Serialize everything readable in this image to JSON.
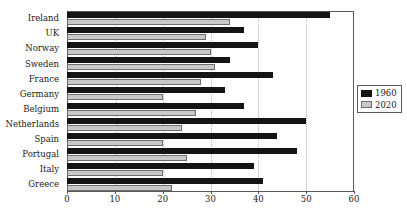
{
  "chart_data": {
    "type": "bar",
    "orientation": "horizontal",
    "title": "",
    "xlabel": "",
    "ylabel": "",
    "xlim": [
      0,
      60
    ],
    "xticks": [
      0,
      10,
      20,
      30,
      40,
      50,
      60
    ],
    "grid": true,
    "legend_position": "right",
    "categories": [
      "Ireland",
      "UK",
      "Norway",
      "Sweden",
      "France",
      "Germany",
      "Belgium",
      "Netherlands",
      "Spain",
      "Portugal",
      "Italy",
      "Greece"
    ],
    "series": [
      {
        "name": "1960",
        "color": "#141414",
        "values": [
          55,
          37,
          40,
          34,
          43,
          33,
          37,
          50,
          44,
          48,
          39,
          41
        ]
      },
      {
        "name": "2020",
        "color": "#c8c8c8",
        "values": [
          34,
          29,
          30,
          31,
          28,
          20,
          27,
          24,
          20,
          25,
          20,
          22
        ]
      }
    ]
  },
  "legend": {
    "entries": [
      {
        "label": "1960"
      },
      {
        "label": "2020"
      }
    ]
  },
  "colors": {
    "series_1960": "#141414",
    "series_2020": "#c8c8c8",
    "frame": "#595959",
    "gridline": "#b8b8b8",
    "background": "#ffffff"
  }
}
